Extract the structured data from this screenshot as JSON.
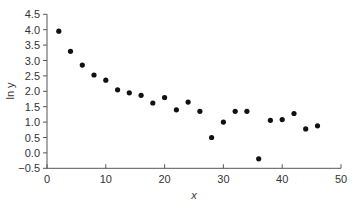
{
  "chart_data": {
    "type": "scatter",
    "title": "",
    "xlabel": "x",
    "ylabel": "ln y",
    "xlim": [
      0,
      50
    ],
    "ylim": [
      -0.5,
      4.5
    ],
    "xticks": [
      0,
      10,
      20,
      30,
      40,
      50
    ],
    "yticks": [
      -0.5,
      0.0,
      0.5,
      1.0,
      1.5,
      2.0,
      2.5,
      3.0,
      3.5,
      4.0,
      4.5
    ],
    "ytick_labels": [
      "−0.5",
      "0.0",
      "0.5",
      "1.0",
      "1.5",
      "2.0",
      "2.5",
      "3.0",
      "3.5",
      "4.0",
      "4.5"
    ],
    "grid": false,
    "legend": null,
    "series": [
      {
        "name": "ln y",
        "color": "#111111",
        "x": [
          2,
          4,
          6,
          8,
          10,
          12,
          14,
          16,
          18,
          20,
          22,
          24,
          26,
          28,
          30,
          32,
          34,
          36,
          38,
          40,
          42,
          44,
          46
        ],
        "y": [
          3.95,
          3.3,
          2.85,
          2.53,
          2.36,
          2.05,
          1.95,
          1.87,
          1.62,
          1.8,
          1.4,
          1.65,
          1.35,
          0.5,
          1.0,
          1.35,
          1.35,
          -0.19,
          1.06,
          1.08,
          1.28,
          0.78,
          0.88
        ]
      }
    ]
  }
}
